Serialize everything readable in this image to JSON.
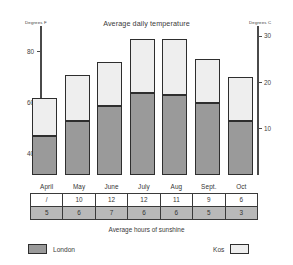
{
  "chart_data": {
    "type": "bar",
    "title": "Average daily temperature",
    "subtitle": "",
    "xlabel": "",
    "ylabel": "Degrees F",
    "ylabel_right": "Degrees C",
    "categories": [
      "April",
      "May",
      "June",
      "July",
      "Aug",
      "Sept.",
      "Oct"
    ],
    "series": [
      {
        "name": "London",
        "color": "#9a9a9a",
        "values": [
          47,
          53,
          59,
          64,
          63,
          60,
          53
        ]
      },
      {
        "name": "Kos",
        "color": "#eeeeee",
        "values": [
          62,
          71,
          76,
          85,
          85,
          77,
          70
        ]
      }
    ],
    "ylim": [
      32,
      90
    ],
    "yticks": [
      40,
      60,
      80
    ],
    "ylim_right": [
      0,
      32
    ],
    "yticks_right": [
      10,
      20,
      30
    ],
    "grid": false,
    "legend_position": "bottom",
    "stacked_note": "Gray lower segment = London, white upper segment top = Kos",
    "table": {
      "caption": "Average hours of sunshine",
      "columns": [
        "April",
        "May",
        "June",
        "July",
        "Aug",
        "Sept.",
        "Oct"
      ],
      "rows": [
        {
          "name": "London",
          "values": [
            "/",
            "10",
            "12",
            "12",
            "11",
            "9",
            "6"
          ]
        },
        {
          "name": "Kos",
          "values": [
            "5",
            "6",
            "7",
            "6",
            "6",
            "5",
            "3"
          ]
        }
      ]
    }
  },
  "axes": {
    "left_title": "Degrees F",
    "right_title": "Degrees C",
    "left_ticks": [
      "80",
      "60",
      "40"
    ],
    "right_ticks": [
      "30",
      "20",
      "10"
    ]
  },
  "legend": {
    "london_label": "London",
    "kos_label": "Kos"
  },
  "table_caption": "Average hours of sunshine",
  "months": [
    "April",
    "May",
    "June",
    "July",
    "Aug",
    "Sept.",
    "Oct"
  ],
  "sunshine_row_a": [
    "/",
    "10",
    "12",
    "12",
    "11",
    "9",
    "6"
  ],
  "sunshine_row_b": [
    "5",
    "6",
    "7",
    "6",
    "6",
    "5",
    "3"
  ]
}
